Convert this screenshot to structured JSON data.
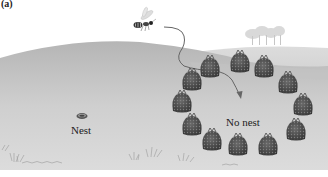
{
  "figure": {
    "panel_label": "(a)",
    "labels": {
      "nest": "Nest",
      "no_nest": "No nest"
    },
    "elements": {
      "insect": "wasp-icon",
      "flight_path": "curved-arrow",
      "nest": "nest-hole-icon",
      "pinecone_count": 12
    },
    "pinecones": [
      {
        "x": 210,
        "y": 67
      },
      {
        "x": 240,
        "y": 62
      },
      {
        "x": 264,
        "y": 67
      },
      {
        "x": 192,
        "y": 80
      },
      {
        "x": 288,
        "y": 83
      },
      {
        "x": 182,
        "y": 102
      },
      {
        "x": 303,
        "y": 105
      },
      {
        "x": 192,
        "y": 125
      },
      {
        "x": 296,
        "y": 130
      },
      {
        "x": 212,
        "y": 140
      },
      {
        "x": 238,
        "y": 145
      },
      {
        "x": 268,
        "y": 145
      }
    ],
    "colors": {
      "sky": "#ffffff",
      "ground_far": "#c9c9c9",
      "ground_near": "#d6d6d6",
      "hill": "#bdbdbd",
      "pinecone": "#4a4a4a",
      "text": "#222222"
    }
  }
}
